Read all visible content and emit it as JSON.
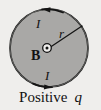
{
  "figure": {
    "caption_text": "Positive",
    "caption_symbol": "q",
    "background_color": "#efeeec",
    "disk": {
      "name": "current-loop-disk",
      "fill_color": "#a9a8a6",
      "stroke_color": "#151515",
      "center_x": 49,
      "center_y": 48,
      "radius": 39
    },
    "labels": {
      "current_top": "I",
      "current_bottom": "I",
      "magnetic_field": "B",
      "radius": "r"
    },
    "symbols": {
      "field_out_of_page": "circle-dot"
    },
    "current_direction": "counterclockwise",
    "arrows": [
      {
        "name": "current-arrow-top",
        "direction": "left"
      },
      {
        "name": "current-arrow-bottom",
        "direction": "right"
      }
    ]
  }
}
